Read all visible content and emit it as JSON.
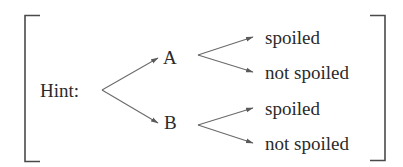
{
  "diagram": {
    "type": "tree",
    "root": {
      "label": "Hint:",
      "children": [
        {
          "label": "A",
          "children": [
            {
              "label": "spoiled"
            },
            {
              "label": "not spoiled"
            }
          ]
        },
        {
          "label": "B",
          "children": [
            {
              "label": "spoiled"
            },
            {
              "label": "not spoiled"
            }
          ]
        }
      ]
    },
    "colors": {
      "line": "#6a6a6a",
      "bracket": "#4a4a4a",
      "text": "#2a2a2a"
    }
  }
}
